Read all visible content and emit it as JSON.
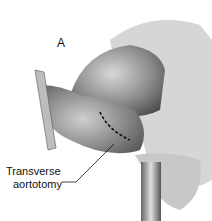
{
  "figure": {
    "panel_label": "A",
    "annotations": [
      {
        "line1": "Transverse",
        "line2": "aortotomy"
      }
    ],
    "colors": {
      "background": "#ffffff",
      "tissue_dark": "#6e6e6e",
      "tissue_light": "#cfcfcf",
      "incision": "#111111"
    }
  }
}
